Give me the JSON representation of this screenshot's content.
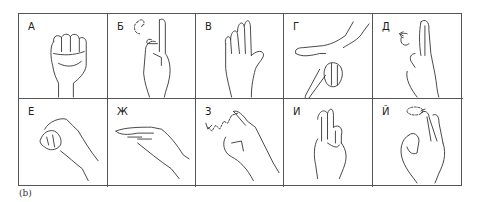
{
  "figure": {
    "caption": "(b)",
    "rows": 2,
    "columns": 5,
    "cells": [
      {
        "letter": "А",
        "gesture": "closed-fist"
      },
      {
        "letter": "Б",
        "gesture": "index-up-with-rotation",
        "motion": "circular-arrow"
      },
      {
        "letter": "В",
        "gesture": "flat-palm-fingers-together"
      },
      {
        "letter": "Г",
        "gesture": "index-pointing-down-thumb-out"
      },
      {
        "letter": "Д",
        "gesture": "two-fingers-up-side-view",
        "motion": "circular-arrow"
      },
      {
        "letter": "Е",
        "gesture": "curved-fingers-to-thumb"
      },
      {
        "letter": "Ж",
        "gesture": "flat-hand-horizontal-fingers-bunched"
      },
      {
        "letter": "З",
        "gesture": "index-tracing-z",
        "motion": "zigzag-arrow"
      },
      {
        "letter": "И",
        "gesture": "index-and-middle-up"
      },
      {
        "letter": "Й",
        "gesture": "index-and-middle-up-ok",
        "motion": "circular-arrow"
      }
    ]
  }
}
